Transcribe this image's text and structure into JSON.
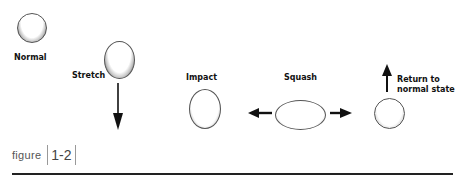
{
  "figure": {
    "caption_word": "figure",
    "caption_number": "1-2",
    "stages": [
      {
        "id": "normal",
        "label": "Normal"
      },
      {
        "id": "stretch",
        "label": "Stretch"
      },
      {
        "id": "impact",
        "label": "Impact"
      },
      {
        "id": "squash",
        "label": "Squash"
      },
      {
        "id": "return",
        "label_line1": "Return to",
        "label_line2": "normal state"
      }
    ],
    "arrows": [
      {
        "stage": "stretch",
        "direction": "down"
      },
      {
        "stage": "squash",
        "direction": "left"
      },
      {
        "stage": "squash",
        "direction": "right"
      },
      {
        "stage": "return",
        "direction": "up"
      }
    ]
  }
}
